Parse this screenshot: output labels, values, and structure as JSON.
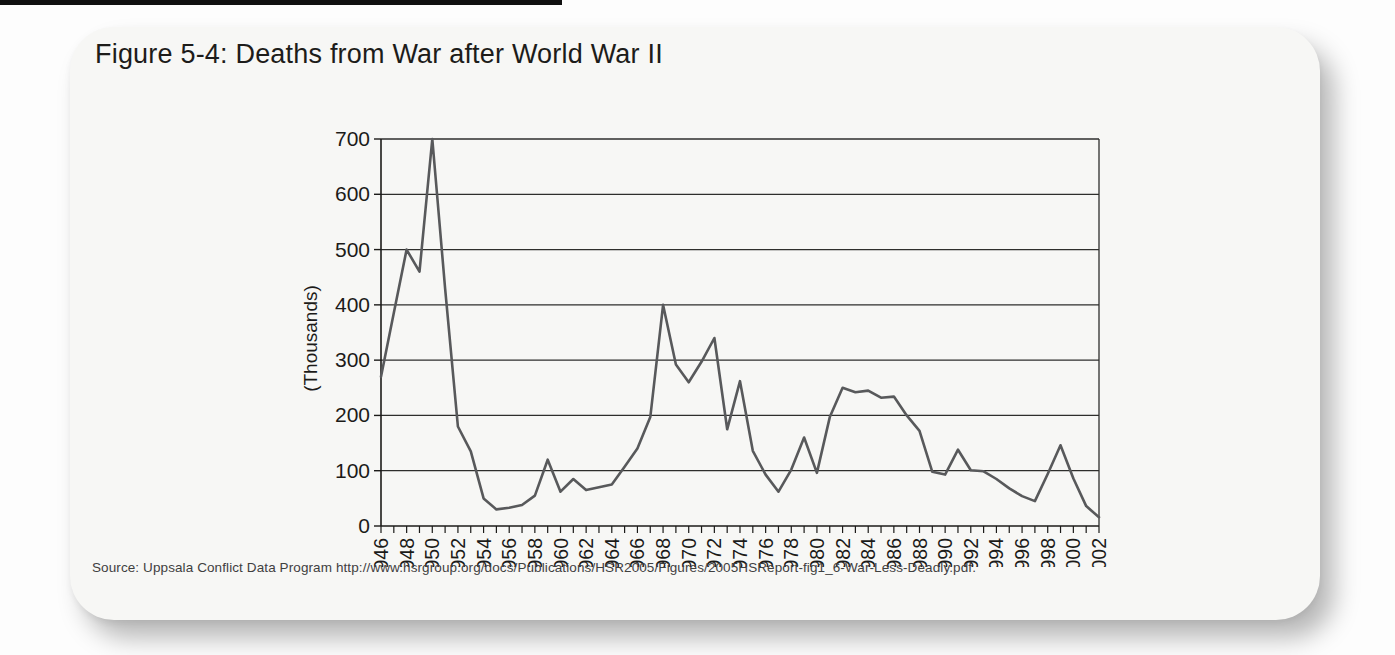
{
  "figure": {
    "title": "Figure 5-4: Deaths from War after World War II",
    "source": "Source: Uppsala Conflict Data Program http://www.hsrgroup.org/docs/Publications/HSR2005/Figures/2005HSReport-fig1_6-War-Less-Deadly.pdf."
  },
  "colors": {
    "card_bg": "#f7f7f5",
    "page_bg": "#fdfdfd",
    "top_strip": "#101010",
    "grid": "#2e2e2c",
    "axis": "#1c1b19",
    "series_line": "#58595b",
    "title_text": "#1d1c1a",
    "source_text": "#3f403f"
  },
  "chart_data": {
    "type": "line",
    "title": "Figure 5-4: Deaths from War after World War II",
    "xlabel": "",
    "ylabel": "(Thousands)",
    "ylim": [
      0,
      700
    ],
    "ytick_interval": 100,
    "xlabel_interval": 2,
    "grid": "horizontal",
    "legend": "none",
    "line_color": "#58595b",
    "categories": [
      1946,
      1947,
      1948,
      1949,
      1950,
      1951,
      1952,
      1953,
      1954,
      1955,
      1956,
      1957,
      1958,
      1959,
      1960,
      1961,
      1962,
      1963,
      1964,
      1965,
      1966,
      1967,
      1968,
      1969,
      1970,
      1971,
      1972,
      1973,
      1974,
      1975,
      1976,
      1977,
      1978,
      1979,
      1980,
      1981,
      1982,
      1983,
      1984,
      1985,
      1986,
      1987,
      1988,
      1989,
      1990,
      1991,
      1992,
      1993,
      1994,
      1995,
      1996,
      1997,
      1998,
      1999,
      2000,
      2001,
      2002
    ],
    "values": [
      270,
      385,
      500,
      460,
      700,
      430,
      180,
      135,
      50,
      30,
      33,
      38,
      55,
      120,
      62,
      85,
      65,
      70,
      75,
      107,
      140,
      197,
      400,
      292,
      260,
      297,
      340,
      175,
      262,
      136,
      93,
      62,
      102,
      160,
      96,
      197,
      250,
      242,
      245,
      232,
      234,
      200,
      172,
      98,
      93,
      138,
      101,
      99,
      85,
      68,
      54,
      45,
      94,
      146,
      86,
      36,
      16
    ]
  }
}
